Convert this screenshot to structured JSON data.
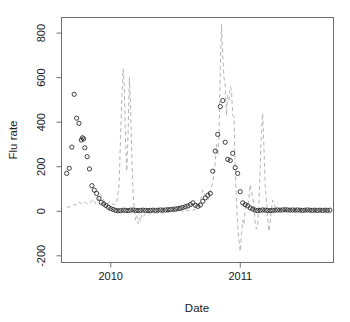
{
  "chart_data": {
    "type": "scatter",
    "title": "",
    "xlabel": "Date",
    "ylabel": "Flu rate",
    "xlim": [
      2009.62,
      2011.72
    ],
    "ylim": [
      -230,
      870
    ],
    "grid": false,
    "legend": null,
    "xticks": [
      {
        "value": 2010,
        "label": "2010"
      },
      {
        "value": 2011,
        "label": "2011"
      }
    ],
    "yticks": [
      {
        "value": -200,
        "label": "-200"
      },
      {
        "value": 0,
        "label": "0"
      },
      {
        "value": 200,
        "label": "200"
      },
      {
        "value": 400,
        "label": "400"
      },
      {
        "value": 600,
        "label": "600"
      },
      {
        "value": 800,
        "label": "800"
      }
    ],
    "series": [
      {
        "name": "observed-flu-rate",
        "type": "scatter",
        "marker": "open-circle",
        "color": "#2b2b2b",
        "points": [
          [
            2009.66,
            170
          ],
          [
            2009.68,
            193
          ],
          [
            2009.7,
            288
          ],
          [
            2009.718,
            525
          ],
          [
            2009.737,
            418
          ],
          [
            2009.755,
            395
          ],
          [
            2009.773,
            320
          ],
          [
            2009.782,
            330
          ],
          [
            2009.791,
            325
          ],
          [
            2009.8,
            285
          ],
          [
            2009.818,
            245
          ],
          [
            2009.836,
            190
          ],
          [
            2009.855,
            115
          ],
          [
            2009.873,
            95
          ],
          [
            2009.891,
            80
          ],
          [
            2009.909,
            58
          ],
          [
            2009.927,
            40
          ],
          [
            2009.945,
            33
          ],
          [
            2009.963,
            26
          ],
          [
            2009.982,
            18
          ],
          [
            2010.0,
            12
          ],
          [
            2010.019,
            8
          ],
          [
            2010.038,
            4
          ],
          [
            2010.057,
            2
          ],
          [
            2010.076,
            3
          ],
          [
            2010.096,
            5
          ],
          [
            2010.115,
            4
          ],
          [
            2010.134,
            3
          ],
          [
            2010.153,
            5
          ],
          [
            2010.173,
            6
          ],
          [
            2010.192,
            4
          ],
          [
            2010.211,
            3
          ],
          [
            2010.23,
            4
          ],
          [
            2010.25,
            5
          ],
          [
            2010.269,
            4
          ],
          [
            2010.288,
            3
          ],
          [
            2010.307,
            4
          ],
          [
            2010.326,
            5
          ],
          [
            2010.346,
            4
          ],
          [
            2010.365,
            5
          ],
          [
            2010.384,
            6
          ],
          [
            2010.403,
            5
          ],
          [
            2010.423,
            6
          ],
          [
            2010.442,
            7
          ],
          [
            2010.461,
            8
          ],
          [
            2010.48,
            9
          ],
          [
            2010.5,
            10
          ],
          [
            2010.519,
            12
          ],
          [
            2010.538,
            14
          ],
          [
            2010.557,
            17
          ],
          [
            2010.576,
            20
          ],
          [
            2010.596,
            24
          ],
          [
            2010.615,
            30
          ],
          [
            2010.634,
            38
          ],
          [
            2010.653,
            27
          ],
          [
            2010.673,
            22
          ],
          [
            2010.692,
            28
          ],
          [
            2010.711,
            45
          ],
          [
            2010.73,
            60
          ],
          [
            2010.75,
            72
          ],
          [
            2010.769,
            80
          ],
          [
            2010.788,
            180
          ],
          [
            2010.807,
            270
          ],
          [
            2010.826,
            345
          ],
          [
            2010.846,
            470
          ],
          [
            2010.865,
            497
          ],
          [
            2010.884,
            310
          ],
          [
            2010.903,
            233
          ],
          [
            2010.923,
            228
          ],
          [
            2010.942,
            260
          ],
          [
            2010.961,
            196
          ],
          [
            2010.98,
            170
          ],
          [
            2011.0,
            88
          ],
          [
            2011.019,
            38
          ],
          [
            2011.038,
            30
          ],
          [
            2011.058,
            24
          ],
          [
            2011.077,
            15
          ],
          [
            2011.096,
            10
          ],
          [
            2011.115,
            5
          ],
          [
            2011.134,
            3
          ],
          [
            2011.154,
            4
          ],
          [
            2011.173,
            6
          ],
          [
            2011.192,
            5
          ],
          [
            2011.211,
            4
          ],
          [
            2011.231,
            3
          ],
          [
            2011.25,
            4
          ],
          [
            2011.269,
            5
          ],
          [
            2011.288,
            6
          ],
          [
            2011.307,
            5
          ],
          [
            2011.327,
            6
          ],
          [
            2011.346,
            7
          ],
          [
            2011.365,
            6
          ],
          [
            2011.384,
            5
          ],
          [
            2011.404,
            6
          ],
          [
            2011.423,
            5
          ],
          [
            2011.442,
            6
          ],
          [
            2011.461,
            5
          ],
          [
            2011.48,
            4
          ],
          [
            2011.5,
            5
          ],
          [
            2011.519,
            6
          ],
          [
            2011.538,
            5
          ],
          [
            2011.558,
            4
          ],
          [
            2011.577,
            5
          ],
          [
            2011.596,
            4
          ],
          [
            2011.615,
            5
          ],
          [
            2011.635,
            4
          ],
          [
            2011.654,
            5
          ],
          [
            2011.673,
            4
          ],
          [
            2011.692,
            5
          ]
        ]
      },
      {
        "name": "model-prediction",
        "type": "line",
        "linestyle": "dashed",
        "color": "#b5b5b5",
        "points": [
          [
            2009.66,
            20
          ],
          [
            2009.68,
            18
          ],
          [
            2009.7,
            25
          ],
          [
            2009.718,
            30
          ],
          [
            2009.737,
            28
          ],
          [
            2009.755,
            40
          ],
          [
            2009.773,
            35
          ],
          [
            2009.791,
            45
          ],
          [
            2009.809,
            38
          ],
          [
            2009.827,
            30
          ],
          [
            2009.845,
            42
          ],
          [
            2009.864,
            55
          ],
          [
            2009.882,
            35
          ],
          [
            2009.9,
            48
          ],
          [
            2009.918,
            80
          ],
          [
            2009.936,
            62
          ],
          [
            2009.955,
            40
          ],
          [
            2009.973,
            30
          ],
          [
            2009.991,
            45
          ],
          [
            2010.01,
            35
          ],
          [
            2010.028,
            28
          ],
          [
            2010.046,
            40
          ],
          [
            2010.065,
            120
          ],
          [
            2010.076,
            330
          ],
          [
            2010.086,
            520
          ],
          [
            2010.096,
            640
          ],
          [
            2010.105,
            560
          ],
          [
            2010.115,
            300
          ],
          [
            2010.124,
            180
          ],
          [
            2010.134,
            350
          ],
          [
            2010.144,
            600
          ],
          [
            2010.153,
            480
          ],
          [
            2010.163,
            240
          ],
          [
            2010.173,
            80
          ],
          [
            2010.182,
            10
          ],
          [
            2010.192,
            -40
          ],
          [
            2010.201,
            -20
          ],
          [
            2010.211,
            -55
          ],
          [
            2010.221,
            -30
          ],
          [
            2010.23,
            -45
          ],
          [
            2010.24,
            -15
          ],
          [
            2010.25,
            -25
          ],
          [
            2010.269,
            -10
          ],
          [
            2010.288,
            -18
          ],
          [
            2010.307,
            -8
          ],
          [
            2010.326,
            -12
          ],
          [
            2010.346,
            -5
          ],
          [
            2010.365,
            -10
          ],
          [
            2010.384,
            -4
          ],
          [
            2010.403,
            -8
          ],
          [
            2010.423,
            -2
          ],
          [
            2010.442,
            -6
          ],
          [
            2010.461,
            0
          ],
          [
            2010.48,
            -4
          ],
          [
            2010.5,
            2
          ],
          [
            2010.519,
            -2
          ],
          [
            2010.538,
            4
          ],
          [
            2010.557,
            0
          ],
          [
            2010.576,
            6
          ],
          [
            2010.596,
            2
          ],
          [
            2010.615,
            8
          ],
          [
            2010.634,
            4
          ],
          [
            2010.653,
            10
          ],
          [
            2010.673,
            20
          ],
          [
            2010.692,
            45
          ],
          [
            2010.711,
            95
          ],
          [
            2010.73,
            70
          ],
          [
            2010.75,
            50
          ],
          [
            2010.769,
            90
          ],
          [
            2010.788,
            130
          ],
          [
            2010.807,
            220
          ],
          [
            2010.817,
            300
          ],
          [
            2010.826,
            250
          ],
          [
            2010.836,
            330
          ],
          [
            2010.846,
            640
          ],
          [
            2010.855,
            840
          ],
          [
            2010.865,
            700
          ],
          [
            2010.875,
            600
          ],
          [
            2010.884,
            560
          ],
          [
            2010.894,
            430
          ],
          [
            2010.903,
            520
          ],
          [
            2010.913,
            500
          ],
          [
            2010.923,
            560
          ],
          [
            2010.932,
            545
          ],
          [
            2010.942,
            430
          ],
          [
            2010.952,
            420
          ],
          [
            2010.961,
            200
          ],
          [
            2010.971,
            40
          ],
          [
            2010.98,
            -60
          ],
          [
            2010.99,
            -130
          ],
          [
            2011.0,
            -180
          ],
          [
            2011.01,
            -100
          ],
          [
            2011.019,
            -40
          ],
          [
            2011.029,
            -60
          ],
          [
            2011.038,
            10
          ],
          [
            2011.048,
            40
          ],
          [
            2011.058,
            20
          ],
          [
            2011.067,
            60
          ],
          [
            2011.077,
            120
          ],
          [
            2011.086,
            90
          ],
          [
            2011.096,
            60
          ],
          [
            2011.105,
            30
          ],
          [
            2011.115,
            -50
          ],
          [
            2011.125,
            -80
          ],
          [
            2011.134,
            -60
          ],
          [
            2011.144,
            30
          ],
          [
            2011.154,
            200
          ],
          [
            2011.163,
            350
          ],
          [
            2011.173,
            440
          ],
          [
            2011.182,
            300
          ],
          [
            2011.192,
            120
          ],
          [
            2011.201,
            60
          ],
          [
            2011.211,
            -20
          ],
          [
            2011.221,
            -90
          ],
          [
            2011.23,
            -60
          ],
          [
            2011.24,
            10
          ],
          [
            2011.25,
            50
          ],
          [
            2011.269,
            20
          ],
          [
            2011.288,
            10
          ],
          [
            2011.307,
            5
          ],
          [
            2011.327,
            8
          ],
          [
            2011.346,
            4
          ],
          [
            2011.365,
            6
          ],
          [
            2011.384,
            3
          ],
          [
            2011.404,
            5
          ],
          [
            2011.423,
            2
          ],
          [
            2011.442,
            4
          ],
          [
            2011.461,
            3
          ],
          [
            2011.48,
            5
          ],
          [
            2011.5,
            2
          ],
          [
            2011.519,
            4
          ],
          [
            2011.538,
            3
          ],
          [
            2011.558,
            5
          ],
          [
            2011.577,
            2
          ],
          [
            2011.596,
            4
          ],
          [
            2011.615,
            3
          ],
          [
            2011.635,
            5
          ],
          [
            2011.654,
            3
          ],
          [
            2011.673,
            4
          ],
          [
            2011.692,
            3
          ]
        ]
      }
    ]
  },
  "style": {
    "frame_color": "#6e6e6e",
    "tick_color": "#6e6e6e",
    "text_color": "#1a1a1a",
    "background": "#ffffff",
    "point_color": "#2b2b2b",
    "line_color": "#b5b5b5"
  }
}
